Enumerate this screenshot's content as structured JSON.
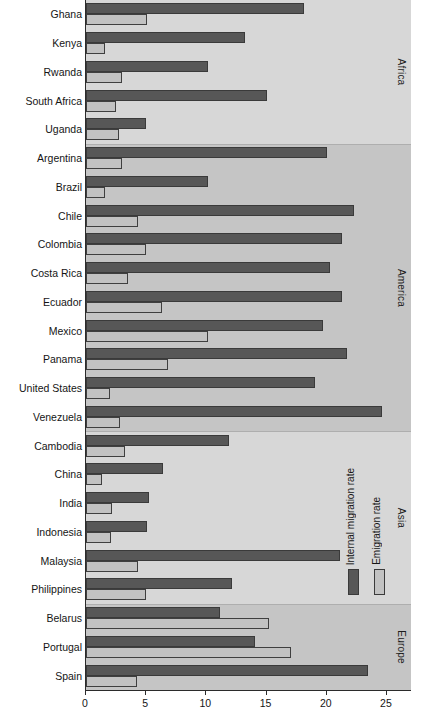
{
  "chart_data": {
    "type": "bar",
    "orientation": "horizontal",
    "title": "",
    "xlabel": "",
    "ylabel": "",
    "xlim": [
      0,
      27
    ],
    "grid": false,
    "xticks": [
      0,
      5,
      10,
      15,
      20,
      25
    ],
    "xtick_labels": [
      "0",
      "5",
      "10",
      "15",
      "20",
      "25"
    ],
    "legend_position": "inside-right",
    "series": [
      {
        "name": "Internal migration rate",
        "color": "#575757",
        "values": [
          18.1,
          13.2,
          10.1,
          15.0,
          5.0,
          20.0,
          10.1,
          22.3,
          21.3,
          20.3,
          21.3,
          19.7,
          21.7,
          19.0,
          24.6,
          11.9,
          6.4,
          5.2,
          5.1,
          21.1,
          12.1,
          11.1,
          14.0,
          23.4
        ]
      },
      {
        "name": "Emigration rate",
        "color": "#c2c2c2",
        "values": [
          5.1,
          1.6,
          3.0,
          2.5,
          2.7,
          3.0,
          1.6,
          4.3,
          5.0,
          3.5,
          6.3,
          10.1,
          6.8,
          2.0,
          2.8,
          3.2,
          1.3,
          2.2,
          2.1,
          4.3,
          5.0,
          15.2,
          17.0,
          4.2
        ]
      }
    ],
    "categories": [
      "Ghana",
      "Kenya",
      "Rwanda",
      "South Africa",
      "Uganda",
      "Argentina",
      "Brazil",
      "Chile",
      "Colombia",
      "Costa Rica",
      "Ecuador",
      "Mexico",
      "Panama",
      "United States",
      "Venezuela",
      "Cambodia",
      "China",
      "India",
      "Indonesia",
      "Malaysia",
      "Philippines",
      "Belarus",
      "Portugal",
      "Spain"
    ],
    "regions": [
      {
        "label": "Africa",
        "start_index": 0,
        "end_index": 4,
        "band_color": "#d7d7d7"
      },
      {
        "label": "America",
        "start_index": 5,
        "end_index": 14,
        "band_color": "#c5c5c5"
      },
      {
        "label": "Asia",
        "start_index": 15,
        "end_index": 20,
        "band_color": "#d7d7d7"
      },
      {
        "label": "Europe",
        "start_index": 21,
        "end_index": 23,
        "band_color": "#c5c5c5"
      }
    ]
  },
  "legend": {
    "entries": [
      {
        "label": "Internal migration rate",
        "color": "#575757"
      },
      {
        "label": "Emigration rate",
        "color": "#c2c2c2"
      }
    ]
  }
}
